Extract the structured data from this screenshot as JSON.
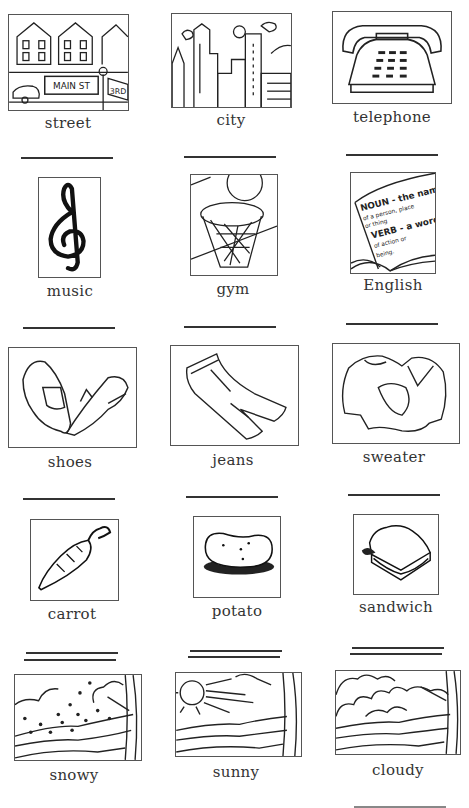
{
  "worksheet": {
    "items": [
      {
        "label": "street"
      },
      {
        "label": "city"
      },
      {
        "label": "telephone"
      },
      {
        "label": "music"
      },
      {
        "label": "gym"
      },
      {
        "label": "English"
      },
      {
        "label": "shoes"
      },
      {
        "label": "jeans"
      },
      {
        "label": "sweater"
      },
      {
        "label": "carrot"
      },
      {
        "label": "potato"
      },
      {
        "label": "sandwich"
      },
      {
        "label": "snowy"
      },
      {
        "label": "sunny"
      },
      {
        "label": "cloudy"
      }
    ],
    "street_sign_main": "MAIN ST",
    "street_sign_3rd": "3RD",
    "english_book_text": [
      "NOUN - the name",
      "of a person, place",
      "or thing",
      "VERB - a word",
      "of action or",
      "being."
    ]
  }
}
